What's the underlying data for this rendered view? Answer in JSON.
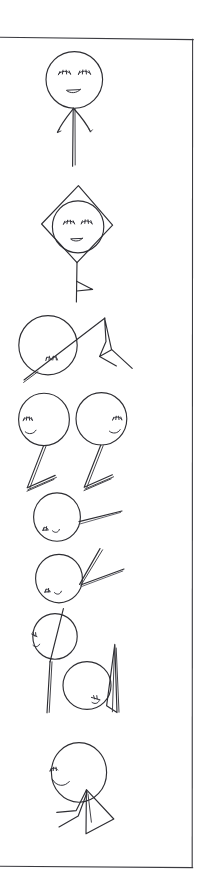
{
  "artwork": {
    "title": "Hand-drawn stick figure sketch strip",
    "medium": "pen on white paper",
    "orientation": "vertical strip",
    "background_color": "#ffffff",
    "ink_color": "#2e2e33",
    "frame_color": "#3b3b40",
    "caption": "",
    "figure_count": 9
  },
  "frame": {
    "name": "hand-ruled-rectangle",
    "top_y": 38,
    "right_x": 193,
    "bottom_y": 868,
    "left_x": -6,
    "stroke_width": 1.1
  },
  "figures": [
    {
      "id": "figure-1",
      "name": "standing-figure-closed-eyes",
      "head_shape": "circle",
      "head_center": [
        74,
        80
      ],
      "head_radius": 28,
      "expression": "closed eyes with lashes, small smile",
      "features": [
        "two arms angled down",
        "single body line"
      ]
    },
    {
      "id": "figure-2",
      "name": "diamond-framed-head",
      "head_shape": "circle inside diamond",
      "head_center": [
        78,
        227
      ],
      "head_radius": 26,
      "expression": "closed eyes with lashes, small smile",
      "features": [
        "diamond outline around head",
        "vertical stem",
        "small flag triangle"
      ]
    },
    {
      "id": "figure-3",
      "name": "head-with-tent",
      "head_shape": "circle",
      "head_center": [
        48,
        345
      ],
      "head_radius": 29,
      "expression": "small lashes lower right",
      "features": [
        "diagonal line through head",
        "tent or mountain shape to the right"
      ]
    },
    {
      "id": "figure-4",
      "name": "left-twin-figure",
      "head_shape": "circle",
      "head_center": [
        44,
        419
      ],
      "head_radius": 25,
      "expression": "closed eye with lashes, small smile, facing right",
      "features": [
        "single leg",
        "foot strokes"
      ]
    },
    {
      "id": "figure-5",
      "name": "right-twin-figure",
      "head_shape": "circle",
      "head_center": [
        101,
        418
      ],
      "head_radius": 25,
      "expression": "closed eye with lashes, small smile, facing left",
      "features": [
        "single leg",
        "foot strokes"
      ]
    },
    {
      "id": "figure-6",
      "name": "head-with-arm-right",
      "head_shape": "circle",
      "head_center": [
        57,
        516
      ],
      "head_radius": 23,
      "expression": "small lashes and smile at lower left",
      "features": [
        "arm extended to the right"
      ]
    },
    {
      "id": "figure-7",
      "name": "head-with-two-arms",
      "head_shape": "circle",
      "head_center": [
        59,
        578
      ],
      "head_radius": 23,
      "expression": "small lashes and smile at lower left",
      "features": [
        "arm up-right",
        "arm out-right"
      ]
    },
    {
      "id": "figure-8",
      "name": "head-on-tall-stem",
      "head_shape": "circle",
      "head_center": [
        55,
        636
      ],
      "head_radius": 22,
      "expression": "small lashes at left",
      "features": [
        "line through head",
        "long vertical legs"
      ]
    },
    {
      "id": "figure-9",
      "name": "head-with-sail",
      "head_shape": "circle",
      "head_center": [
        87,
        685
      ],
      "head_radius": 24,
      "expression": "small lashes at lower right",
      "features": [
        "tall narrow sail shape to the right"
      ]
    },
    {
      "id": "figure-10",
      "name": "head-with-triangle-body",
      "head_shape": "circle",
      "head_center": [
        79,
        775
      ],
      "head_radius": 28,
      "expression": "closed eye with lashes, smile, facing left",
      "features": [
        "triangle body",
        "two legs trailing left"
      ]
    }
  ]
}
